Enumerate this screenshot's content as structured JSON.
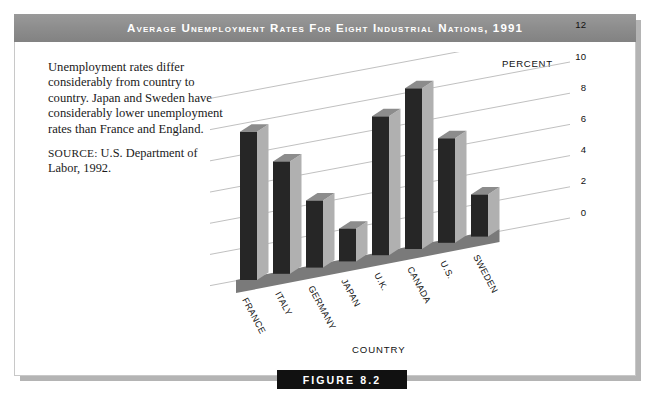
{
  "title": "Average Unemployment Rates for Eight Industrial Nations, 1991",
  "caption": {
    "body": "Unemployment rates differ considerably from country to country. Japan and Sweden have considerably lower unemployment rates than France and England.",
    "source_label": "SOURCE:",
    "source_text": " U.S. Department of Labor, 1992."
  },
  "figure": {
    "tag": "FIGURE 8.2"
  },
  "colors": {
    "banner": "#8e8e8e",
    "banner_text": "#ffffff",
    "bar_front": "#262626",
    "bar_side": "#b0b0b0",
    "bar_top": "#8c8c8c",
    "floor": "#7a7a7a",
    "gridline": "#b9b9b9",
    "figure_tag_bg": "#111111"
  },
  "chart_data": {
    "type": "bar",
    "title": "Average Unemployment Rates for Eight Industrial Nations, 1991",
    "xlabel": "COUNTRY",
    "ylabel": "PERCENT",
    "categories": [
      "FRANCE",
      "ITALY",
      "GERMANY",
      "JAPAN",
      "U.K.",
      "CANADA",
      "U.S.",
      "SWEDEN"
    ],
    "values": [
      9.5,
      7.2,
      4.3,
      2.1,
      8.9,
      10.3,
      6.7,
      2.7
    ],
    "ylim": [
      0,
      12
    ],
    "yticks": [
      0,
      2,
      4,
      6,
      8,
      10,
      12
    ],
    "ytick_labels": [
      "0",
      "2",
      "4",
      "6",
      "8",
      "10",
      "12"
    ],
    "grid": true,
    "legend": "none",
    "projection": "3d-isometric"
  }
}
